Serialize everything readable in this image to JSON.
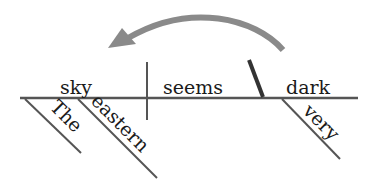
{
  "diagram": {
    "type": "sentence-diagram",
    "sentence": "The eastern sky seems very dark",
    "subject": "sky",
    "verb": "seems",
    "predicate_adjective": "dark",
    "modifiers": {
      "subject": [
        "The",
        "eastern"
      ],
      "predicate_adjective": [
        "very"
      ]
    },
    "arrow": {
      "from": "dark",
      "to": "sky",
      "color": "#8a8a8a"
    },
    "line_color": "#555555"
  }
}
